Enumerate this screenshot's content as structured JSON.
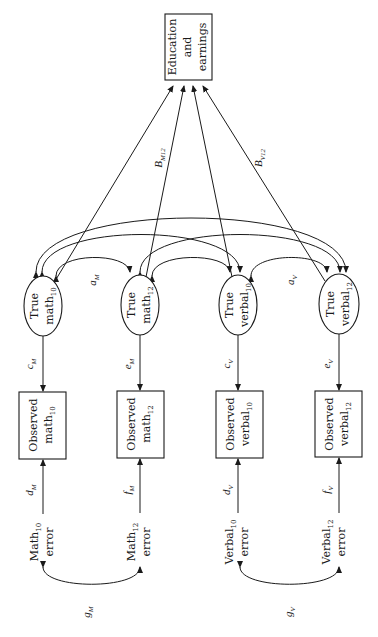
{
  "outcome": {
    "line1": "Education",
    "line2": "and",
    "line3": "earnings"
  },
  "latent": [
    {
      "line1": "True",
      "base": "math",
      "sub": "10"
    },
    {
      "line1": "True",
      "base": "math",
      "sub": "12"
    },
    {
      "line1": "True",
      "base": "verbal",
      "sub": "10"
    },
    {
      "line1": "True",
      "base": "verbal",
      "sub": "12"
    }
  ],
  "observed": [
    {
      "line1": "Observed",
      "base": "math",
      "sub": "10"
    },
    {
      "line1": "Observed",
      "base": "math",
      "sub": "12"
    },
    {
      "line1": "Observed",
      "base": "verbal",
      "sub": "10"
    },
    {
      "line1": "Observed",
      "base": "verbal",
      "sub": "12"
    }
  ],
  "errors": [
    {
      "base": "Math",
      "sub": "10",
      "line2": "error"
    },
    {
      "base": "Math",
      "sub": "12",
      "line2": "error"
    },
    {
      "base": "Verbal",
      "sub": "10",
      "line2": "error"
    },
    {
      "base": "Verbal",
      "sub": "12",
      "line2": "error"
    }
  ],
  "path_labels": {
    "beta_m12": {
      "base": "B",
      "sub": "M12"
    },
    "beta_v12": {
      "base": "B",
      "sub": "V12"
    },
    "a_m": {
      "base": "a",
      "sub": "M"
    },
    "a_v": {
      "base": "a",
      "sub": "V"
    },
    "loadings": [
      {
        "base": "c",
        "sub": "M"
      },
      {
        "base": "e",
        "sub": "M"
      },
      {
        "base": "c",
        "sub": "V"
      },
      {
        "base": "e",
        "sub": "V"
      }
    ],
    "error_paths": [
      {
        "base": "d",
        "sub": "M"
      },
      {
        "base": "f",
        "sub": "M"
      },
      {
        "base": "d",
        "sub": "V"
      },
      {
        "base": "f",
        "sub": "V"
      }
    ],
    "g_m": {
      "base": "g",
      "sub": "M"
    },
    "g_v": {
      "base": "g",
      "sub": "V"
    }
  }
}
